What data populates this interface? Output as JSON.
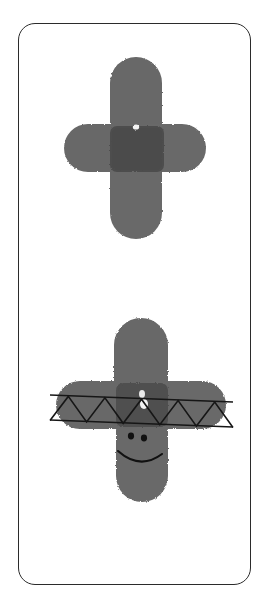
{
  "page": {
    "title": "Fingerprint Cross Figures",
    "background_color": "#ffffff",
    "width": 278,
    "height": 602
  },
  "card": {
    "label": "Rounded rectangle border frame",
    "border_color": "#2b2b2b",
    "corner_radius": 17,
    "x": 18,
    "y": 23,
    "width": 233,
    "height": 562
  },
  "figures": [
    {
      "id": "upper-figure",
      "label": "Plain fingerprint cross figure",
      "description": "Cross-shaped figure made of four overlapping thumbprint strokes, no face or accessories",
      "ink_color": "#6e6e6e",
      "core_color": "#4a4a4a",
      "center_x": 135,
      "center_y": 148,
      "vertical_top": 57,
      "vertical_bottom": 239,
      "horizontal_left": 64,
      "horizontal_right": 206,
      "has_face": false,
      "has_band": false,
      "highlight_spot": {
        "x": 136,
        "y": 127,
        "radius": 3
      }
    },
    {
      "id": "lower-figure",
      "label": "Fingerprint cross figure with zigzag band and smiley face",
      "description": "Cross-shaped figure made of thumbprint strokes, wearing a zigzag-patterned sash band across the arms and a smiling face below it",
      "ink_color": "#6e6e6e",
      "core_color": "#4a4a4a",
      "center_x": 140,
      "center_y": 408,
      "vertical_top": 318,
      "vertical_bottom": 502,
      "horizontal_left": 56,
      "horizontal_right": 226,
      "has_face": true,
      "has_band": true,
      "highlight_spot": {
        "x": 144,
        "y": 404,
        "radius": 4
      }
    }
  ],
  "band": {
    "label": "Zigzag patterned sash band",
    "line_color": "#161616",
    "left_x": 50,
    "right_x": 233,
    "top_y_left": 395,
    "top_y_right": 402,
    "bottom_y_left": 420,
    "bottom_y_right": 427,
    "zigzag_peaks": 5,
    "stroke_width": 1.6
  },
  "face": {
    "label": "Smiley face on lower figure",
    "eye_color": "#111111",
    "mouth_color": "#111111",
    "left_eye": {
      "x": 131,
      "y": 436,
      "rx": 3.1,
      "ry": 3.4
    },
    "right_eye": {
      "x": 144,
      "y": 438,
      "rx": 3.1,
      "ry": 3.4
    },
    "mouth": {
      "left_x": 118,
      "left_y": 451,
      "right_x": 162,
      "right_y": 454,
      "depth": 18
    }
  },
  "texture": {
    "label": "Fingerprint ridge texture",
    "ridge_color": "#5c5c5c",
    "ridge_spacing": 2.0,
    "style": "concentric whorl ridges"
  }
}
